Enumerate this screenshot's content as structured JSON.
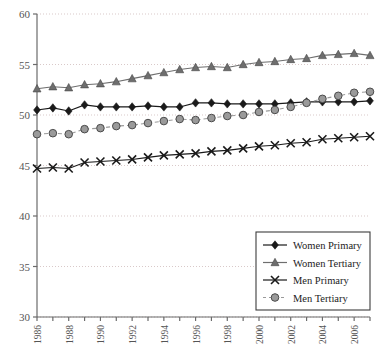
{
  "chart_data": {
    "type": "line",
    "title": "",
    "xlabel": "",
    "ylabel": "",
    "xlim": [
      1986,
      2007
    ],
    "ylim": [
      30,
      60
    ],
    "yticks": [
      30,
      35,
      40,
      45,
      50,
      55,
      60
    ],
    "ytick_labels": [
      "30",
      "35",
      "40",
      "45",
      "50",
      "55",
      "60"
    ],
    "xticks": [
      1986,
      1987,
      1988,
      1989,
      1990,
      1991,
      1992,
      1993,
      1994,
      1995,
      1996,
      1997,
      1998,
      1999,
      2000,
      2001,
      2002,
      2003,
      2004,
      2005,
      2006,
      2007
    ],
    "xtick_labels": [
      "1986",
      "",
      "1988",
      "",
      "1990",
      "",
      "1992",
      "",
      "1994",
      "",
      "1996",
      "",
      "1998",
      "",
      "2000",
      "",
      "2002",
      "",
      "2004",
      "",
      "2006",
      ""
    ],
    "x": [
      1986,
      1987,
      1988,
      1989,
      1990,
      1991,
      1992,
      1993,
      1994,
      1995,
      1996,
      1997,
      1998,
      1999,
      2000,
      2001,
      2002,
      2003,
      2004,
      2005,
      2006,
      2007
    ],
    "grid": true,
    "grid_style": "dotted-horizontal",
    "legend_position": "bottom-right",
    "series": [
      {
        "name": "Women Primary",
        "marker": "diamond",
        "color": "#1a1a1a",
        "linestyle": "solid",
        "values": [
          50.5,
          50.7,
          50.4,
          51.0,
          50.8,
          50.8,
          50.8,
          50.9,
          50.8,
          50.8,
          51.2,
          51.2,
          51.1,
          51.1,
          51.1,
          51.1,
          51.2,
          51.3,
          51.3,
          51.3,
          51.3,
          51.4
        ]
      },
      {
        "name": "Women Tertiary",
        "marker": "triangle",
        "color": "#6e6e6e",
        "linestyle": "solid",
        "values": [
          52.6,
          52.8,
          52.7,
          53.0,
          53.1,
          53.3,
          53.6,
          53.9,
          54.2,
          54.5,
          54.7,
          54.8,
          54.7,
          55.0,
          55.2,
          55.3,
          55.5,
          55.6,
          55.9,
          56.0,
          56.1,
          55.9
        ]
      },
      {
        "name": "Men Primary",
        "marker": "x",
        "color": "#1a1a1a",
        "linestyle": "solid",
        "values": [
          44.7,
          44.8,
          44.7,
          45.3,
          45.4,
          45.5,
          45.6,
          45.8,
          46.0,
          46.1,
          46.2,
          46.4,
          46.5,
          46.7,
          46.9,
          47.0,
          47.2,
          47.3,
          47.6,
          47.7,
          47.8,
          47.9
        ]
      },
      {
        "name": "Men Tertiary",
        "marker": "circle",
        "color": "#9a9a9a",
        "linestyle": "dashed",
        "values": [
          48.1,
          48.2,
          48.1,
          48.6,
          48.7,
          48.9,
          49.0,
          49.2,
          49.4,
          49.6,
          49.5,
          49.7,
          49.9,
          50.0,
          50.3,
          50.5,
          50.8,
          51.2,
          51.6,
          51.9,
          52.2,
          52.3
        ]
      }
    ],
    "legend": {
      "items": [
        {
          "label": "Women Primary",
          "marker": "diamond",
          "color": "#1a1a1a",
          "linestyle": "solid"
        },
        {
          "label": "Women Tertiary",
          "marker": "triangle",
          "color": "#6e6e6e",
          "linestyle": "solid"
        },
        {
          "label": "Men Primary",
          "marker": "x",
          "color": "#1a1a1a",
          "linestyle": "solid"
        },
        {
          "label": "Men Tertiary",
          "marker": "circle",
          "color": "#9a9a9a",
          "linestyle": "dashed"
        }
      ]
    },
    "colors": {
      "axis": "#6b6b6b",
      "grid": "#d9c9c9",
      "tick_label": "#555555",
      "legend_border": "#3c3c3c",
      "background": "#ffffff"
    }
  }
}
